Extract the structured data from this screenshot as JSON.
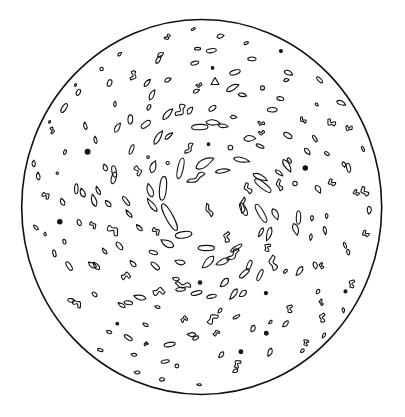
{
  "figure": {
    "width": 405,
    "height": 417,
    "background": "#ffffff",
    "stroke_color": "#111111",
    "boundary": {
      "cx": 201.7,
      "cy": 207,
      "rx": 180,
      "ry": 187.5,
      "stroke_width": 1.6
    },
    "vortex_center": {
      "x": 205,
      "y": 202
    },
    "blob_stroke_width": 1.1,
    "rings": [
      {
        "r": 40,
        "count": 10,
        "size": 6.5,
        "elong": 2.6,
        "phase": 0.3
      },
      {
        "r": 58,
        "count": 18,
        "size": 5.5,
        "elong": 2.3,
        "phase": 0.9
      },
      {
        "r": 75,
        "count": 24,
        "size": 5.0,
        "elong": 2.0,
        "phase": 0.1
      },
      {
        "r": 92,
        "count": 28,
        "size": 4.6,
        "elong": 1.9,
        "phase": 0.6
      },
      {
        "r": 110,
        "count": 30,
        "size": 4.2,
        "elong": 1.8,
        "phase": 1.2
      },
      {
        "r": 128,
        "count": 32,
        "size": 4.0,
        "elong": 1.7,
        "phase": 0.4
      },
      {
        "r": 146,
        "count": 34,
        "size": 3.8,
        "elong": 1.6,
        "phase": 0.8
      },
      {
        "r": 163,
        "count": 34,
        "size": 3.6,
        "elong": 1.6,
        "phase": 0.2
      },
      {
        "r": 176,
        "count": 30,
        "size": 3.2,
        "elong": 1.5,
        "phase": 1.0
      }
    ],
    "special_blobs": [
      {
        "x": 196,
        "y": 178,
        "w": 20,
        "h": 5,
        "angle": -25,
        "kind": "squiggle"
      },
      {
        "x": 209,
        "y": 210,
        "w": 14,
        "h": 4,
        "angle": 70,
        "kind": "squiggle"
      },
      {
        "x": 243,
        "y": 205,
        "w": 16,
        "h": 4,
        "angle": 100,
        "kind": "squiggle"
      },
      {
        "x": 183,
        "y": 285,
        "w": 16,
        "h": 5,
        "angle": 15,
        "kind": "squiggle"
      },
      {
        "x": 233,
        "y": 255,
        "w": 16,
        "h": 5,
        "angle": -40,
        "kind": "squiggle"
      },
      {
        "x": 215,
        "y": 81,
        "w": 8,
        "h": 7,
        "angle": 0,
        "kind": "triangle"
      }
    ],
    "seed": 1729
  }
}
